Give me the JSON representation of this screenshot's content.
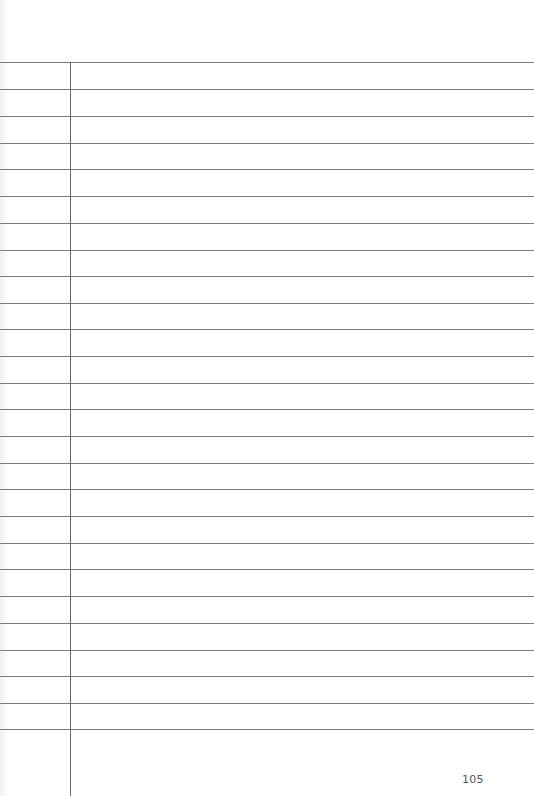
{
  "page": {
    "type": "lined-notebook-page",
    "page_number": "105",
    "rule_count": 26,
    "rule_positions_y": [
      62,
      89,
      116,
      143,
      169,
      196,
      223,
      250,
      276,
      303,
      329,
      356,
      383,
      409,
      436,
      463,
      489,
      516,
      543,
      569,
      596,
      623,
      650,
      676,
      703,
      729
    ],
    "margin_line_x": 70,
    "colors": {
      "background": "#ffffff",
      "rule": "#7a7a7a",
      "margin": "#6a6a6a",
      "page_number": "#555555"
    }
  }
}
